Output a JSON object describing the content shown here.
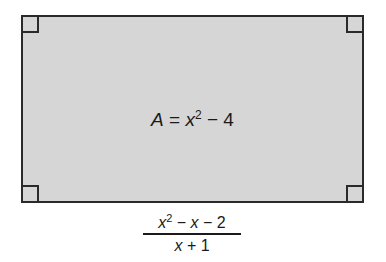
{
  "diagram": {
    "type": "rectangle",
    "fill_color": "#d6d6d6",
    "border_color": "#2a2a2a",
    "right_angle_markers": [
      "top-left",
      "top-right",
      "bottom-left",
      "bottom-right"
    ],
    "area_label": {
      "lhs": "A",
      "equals": "=",
      "var": "x",
      "exponent": "2",
      "rest": "− 4",
      "full_text": "A = x^2 − 4"
    },
    "side_label": {
      "numerator": {
        "var1": "x",
        "exponent": "2",
        "op1": "−",
        "var2": "x",
        "op2": "− 2",
        "full_text": "x^2 − x − 2"
      },
      "denominator": {
        "var": "x",
        "rest": "+ 1",
        "full_text": "x + 1"
      },
      "full_text": "(x^2 − x − 2)/(x + 1)"
    }
  }
}
